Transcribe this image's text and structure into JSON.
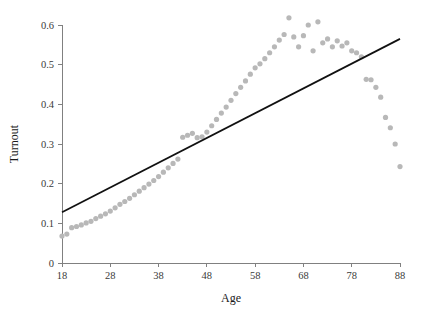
{
  "chart_data": {
    "type": "scatter",
    "title": "",
    "xlabel": "Age",
    "ylabel": "Turnout",
    "xlim": [
      18,
      88
    ],
    "ylim": [
      0,
      0.64
    ],
    "grid": false,
    "legend": "none",
    "xticks": [
      18,
      28,
      38,
      48,
      58,
      68,
      78,
      88
    ],
    "xtick_labels": [
      "18",
      "28",
      "38",
      "48",
      "58",
      "68",
      "78",
      "88"
    ],
    "yticks": [
      0,
      0.1,
      0.2,
      0.3,
      0.4,
      0.5,
      0.6
    ],
    "ytick_labels": [
      "0",
      "0.1",
      "0.2",
      "0.3",
      "0.4",
      "0.5",
      "0.6"
    ],
    "point_color": "#b8b8b8",
    "line_color": "#111111",
    "axis_color": "#808080",
    "series": [
      {
        "name": "Turnout by age",
        "type": "scatter",
        "marker": "circle",
        "x": [
          18,
          19,
          20,
          21,
          22,
          23,
          24,
          25,
          26,
          27,
          28,
          29,
          30,
          31,
          32,
          33,
          34,
          35,
          36,
          37,
          38,
          39,
          40,
          41,
          42,
          43,
          44,
          45,
          46,
          47,
          48,
          49,
          50,
          51,
          52,
          53,
          54,
          55,
          56,
          57,
          58,
          59,
          60,
          61,
          62,
          63,
          64,
          65,
          66,
          67,
          68,
          69,
          70,
          71,
          72,
          73,
          74,
          75,
          76,
          77,
          78,
          79,
          80,
          81,
          82,
          83,
          84,
          85,
          86,
          87,
          88
        ],
        "y": [
          0.068,
          0.073,
          0.089,
          0.092,
          0.096,
          0.101,
          0.105,
          0.112,
          0.118,
          0.124,
          0.131,
          0.139,
          0.148,
          0.155,
          0.163,
          0.172,
          0.181,
          0.19,
          0.199,
          0.208,
          0.218,
          0.229,
          0.24,
          0.251,
          0.262,
          0.317,
          0.322,
          0.327,
          0.316,
          0.318,
          0.33,
          0.346,
          0.362,
          0.378,
          0.393,
          0.41,
          0.427,
          0.443,
          0.459,
          0.476,
          0.492,
          0.502,
          0.515,
          0.53,
          0.545,
          0.562,
          0.576,
          0.618,
          0.57,
          0.545,
          0.573,
          0.6,
          0.535,
          0.608,
          0.555,
          0.565,
          0.545,
          0.56,
          0.547,
          0.555,
          0.535,
          0.53,
          0.52,
          0.463,
          0.462,
          0.443,
          0.418,
          0.367,
          0.341,
          0.3,
          0.243
        ]
      },
      {
        "name": "Linear fit",
        "type": "line",
        "x": [
          18,
          88
        ],
        "y": [
          0.128,
          0.565
        ]
      }
    ]
  },
  "figure": {
    "xlabel_text": "Age",
    "ylabel_text": "Turnout"
  }
}
